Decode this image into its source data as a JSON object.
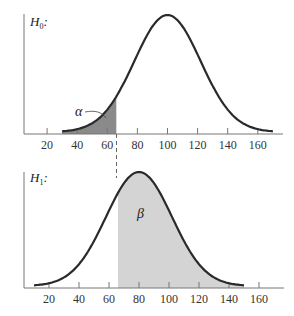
{
  "chart_data": [
    {
      "type": "area",
      "title": "H0:",
      "distribution": "normal",
      "mean": 100,
      "x_range": [
        30,
        170
      ],
      "critical_value": 66,
      "shaded_region": {
        "from": 30,
        "to": 66,
        "label": "α",
        "meaning": "Type I error probability"
      },
      "xticks": [
        20,
        40,
        60,
        80,
        100,
        120,
        140,
        160
      ],
      "xlabel": "",
      "ylabel": ""
    },
    {
      "type": "area",
      "title": "H1:",
      "distribution": "normal",
      "mean": 80,
      "x_range": [
        10,
        150
      ],
      "critical_value": 66,
      "shaded_region": {
        "from": 66,
        "to": 150,
        "label": "β",
        "meaning": "Type II error probability"
      },
      "xticks": [
        20,
        40,
        60,
        80,
        100,
        120,
        140,
        160
      ],
      "xlabel": "",
      "ylabel": ""
    }
  ],
  "labels": {
    "h0": "H",
    "h0_sub": "0",
    "h0_colon": ":",
    "h1": "H",
    "h1_sub": "1",
    "h1_colon": ":",
    "alpha": "α",
    "beta": "β"
  },
  "ticks": [
    "20",
    "40",
    "60",
    "80",
    "100",
    "120",
    "140",
    "160"
  ],
  "colors": {
    "curve": "#2a2a2a",
    "alpha_fill": "#8a8a8a",
    "beta_fill": "#d4d4d4",
    "axis": "#555555"
  }
}
